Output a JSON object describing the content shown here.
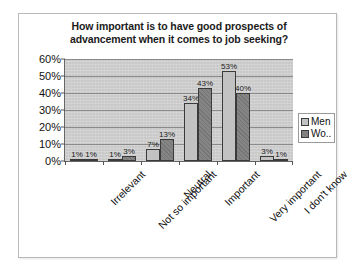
{
  "chart_data": {
    "type": "bar",
    "title": "How important is to have good prospects of advancement when it comes to job seeking?",
    "title_lines": [
      "How important is to have good prospects of",
      "advancement when it comes to job seeking?"
    ],
    "xlabel": "",
    "ylabel": "",
    "ylim": [
      0,
      60
    ],
    "ytick_labels": [
      "60%",
      "50%",
      "40%",
      "30%",
      "20%",
      "10%",
      "0%"
    ],
    "ytick_values": [
      60,
      50,
      40,
      30,
      20,
      10,
      0
    ],
    "grid": true,
    "legend_position": "right",
    "categories": [
      "Irrelevant",
      "Not so important",
      "Neutral",
      "Important",
      "Very important",
      "I don't know"
    ],
    "series": [
      {
        "name": "Men",
        "legend_label": "Men",
        "color": "#c2c2c2",
        "values": [
          1,
          1,
          7,
          34,
          53,
          3
        ],
        "labels": [
          "1%",
          "1%",
          "7%",
          "34%",
          "53%",
          "3%"
        ]
      },
      {
        "name": "Women",
        "legend_label": "Wo..",
        "color": "#858585",
        "values": [
          1,
          3,
          13,
          43,
          40,
          1
        ],
        "labels": [
          "1%",
          "3%",
          "13%",
          "43%",
          "40%",
          "1%"
        ]
      }
    ]
  },
  "legend": {
    "items": [
      {
        "label": "Men"
      },
      {
        "label": "Wo.."
      }
    ]
  }
}
